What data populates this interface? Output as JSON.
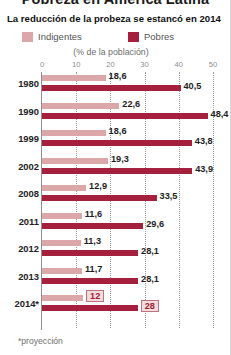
{
  "masthead": {
    "title": "Pobreza en América Latina"
  },
  "headline": {
    "text": "La reducción de la probeza se estancó en 2014"
  },
  "legend": {
    "indigentes_label": "Indigentes",
    "pobres_label": "Pobres",
    "indigentes_color": "#dba7a9",
    "pobres_color": "#a4203c"
  },
  "subtitle": {
    "text": "(% de la población)"
  },
  "footnote": {
    "text": "*proyección"
  },
  "chart_data": {
    "type": "bar",
    "title": "La reducción de la probeza se estancó en 2014",
    "subtitle": "(% de la población)",
    "orientation": "horizontal",
    "xlabel": "",
    "ylabel": "",
    "xlim": [
      0,
      50
    ],
    "ticks": [
      0,
      10,
      20,
      30,
      40,
      50
    ],
    "tick_labels": [
      "0",
      "10",
      "20",
      "30",
      "40",
      "50"
    ],
    "grid": true,
    "legend_position": "top",
    "categories": [
      "1980",
      "1990",
      "1999",
      "2002",
      "2008",
      "2011",
      "2012",
      "2013",
      "2014*"
    ],
    "series": [
      {
        "name": "Indigentes",
        "color": "#dba7a9",
        "values": [
          18.6,
          22.6,
          18.6,
          19.3,
          12.9,
          11.6,
          11.3,
          11.7,
          12
        ],
        "value_labels": [
          "18,6",
          "22,6",
          "18,6",
          "19,3",
          "12,9",
          "11,6",
          "11,3",
          "11,7",
          "12"
        ]
      },
      {
        "name": "Pobres",
        "color": "#a4203c",
        "values": [
          40.5,
          48.4,
          43.8,
          43.9,
          33.5,
          29.6,
          28.1,
          28.1,
          28
        ],
        "value_labels": [
          "40,5",
          "48,4",
          "43,8",
          "43,9",
          "33,5",
          "29,6",
          "28,1",
          "28,1",
          "28"
        ]
      }
    ],
    "highlighted_category": "2014*",
    "annotations": [
      "*proyección"
    ]
  }
}
